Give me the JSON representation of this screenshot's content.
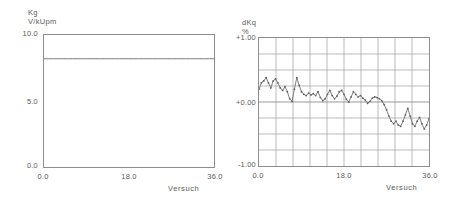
{
  "charts": [
    {
      "id": "kg-chart",
      "ylabel_line1": "Kg",
      "ylabel_line2": "V/kUpm",
      "xlabel": "Versuch",
      "yticks": [
        "10.0",
        "5.0",
        "0.0"
      ],
      "xticks": [
        "0.0",
        "18.0",
        "36.0"
      ]
    },
    {
      "id": "dkq-chart",
      "ylabel_line1": "dKq",
      "ylabel_line2": "%",
      "xlabel": "Versuch",
      "yticks": [
        "+1.00",
        "+0.00",
        "-1.00"
      ],
      "xticks": [
        "0.0",
        "18.0",
        "36.0"
      ]
    }
  ],
  "chart_data": [
    {
      "type": "line",
      "title": "",
      "xlabel": "Versuch",
      "ylabel": "Kg V/kUpm",
      "xlim": [
        0,
        36
      ],
      "ylim": [
        0,
        10
      ],
      "xticks": [
        0,
        18,
        36
      ],
      "yticks": [
        0,
        5,
        10
      ],
      "grid": false,
      "markers": false,
      "legend": "none",
      "series": [
        {
          "name": "Kg V/kUpm",
          "x": [
            0,
            1,
            2,
            3,
            4,
            5,
            6,
            7,
            8,
            9,
            10,
            11,
            12,
            13,
            14,
            15,
            16,
            17,
            18,
            19,
            20,
            21,
            22,
            23,
            24,
            25,
            26,
            27,
            28,
            29,
            30,
            31,
            32,
            33,
            34,
            35,
            36
          ],
          "values": [
            8.2,
            8.2,
            8.2,
            8.2,
            8.2,
            8.2,
            8.2,
            8.2,
            8.2,
            8.2,
            8.2,
            8.2,
            8.2,
            8.2,
            8.2,
            8.2,
            8.2,
            8.2,
            8.2,
            8.2,
            8.2,
            8.2,
            8.2,
            8.2,
            8.2,
            8.2,
            8.2,
            8.2,
            8.2,
            8.2,
            8.2,
            8.2,
            8.2,
            8.2,
            8.2,
            8.2,
            8.2
          ]
        }
      ]
    },
    {
      "type": "line",
      "title": "",
      "xlabel": "Versuch",
      "ylabel": "dKq %",
      "xlim": [
        0,
        36
      ],
      "ylim": [
        -1.0,
        1.0
      ],
      "xticks": [
        0,
        18,
        36
      ],
      "yticks": [
        -1.0,
        0.0,
        1.0
      ],
      "grid": true,
      "grid_rows": 8,
      "grid_cols": 10,
      "markers": true,
      "legend": "none",
      "series": [
        {
          "name": "dKq %",
          "x": [
            0,
            0.5,
            1,
            1.5,
            2,
            2.5,
            3,
            3.5,
            4,
            4.5,
            5,
            5.5,
            6,
            6.5,
            7,
            7.5,
            8,
            8.5,
            9,
            9.5,
            10,
            10.5,
            11,
            11.5,
            12,
            12.5,
            13,
            13.5,
            14,
            14.5,
            15,
            15.5,
            16,
            16.5,
            17,
            17.5,
            18,
            18.5,
            19,
            19.5,
            20,
            20.5,
            21,
            21.5,
            22,
            22.5,
            23,
            23.5,
            24,
            24.5,
            25,
            25.5,
            26,
            26.5,
            27,
            27.5,
            28,
            28.5,
            29,
            29.5,
            30,
            30.5,
            31,
            31.5,
            32,
            32.5,
            33,
            33.5,
            34,
            34.5,
            35,
            35.5,
            36
          ],
          "values": [
            0.2,
            0.3,
            0.33,
            0.38,
            0.3,
            0.22,
            0.33,
            0.36,
            0.3,
            0.22,
            0.18,
            0.24,
            0.16,
            0.05,
            0.01,
            0.2,
            0.38,
            0.26,
            0.16,
            0.12,
            0.1,
            0.14,
            0.11,
            0.13,
            0.1,
            0.16,
            0.07,
            0.02,
            0.05,
            0.12,
            0.18,
            0.1,
            0.05,
            0.09,
            0.16,
            0.18,
            0.12,
            0.04,
            0.0,
            0.08,
            0.16,
            0.12,
            0.08,
            0.1,
            0.06,
            0.03,
            -0.02,
            0.01,
            0.06,
            0.08,
            0.07,
            0.05,
            0.02,
            -0.04,
            -0.12,
            -0.22,
            -0.3,
            -0.34,
            -0.3,
            -0.36,
            -0.38,
            -0.3,
            -0.2,
            -0.1,
            -0.22,
            -0.34,
            -0.38,
            -0.3,
            -0.24,
            -0.34,
            -0.42,
            -0.36,
            -0.26
          ]
        }
      ]
    }
  ]
}
